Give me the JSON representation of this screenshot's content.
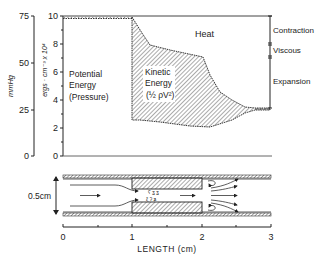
{
  "left_axis": {
    "label": "mmHg",
    "ticks": [
      "75",
      "50",
      "25",
      "0"
    ]
  },
  "right_axis": {
    "label": "ergs · cm⁻³ x 10⁴",
    "ticks": [
      "10",
      "8",
      "6",
      "4",
      "2",
      "0"
    ]
  },
  "regions": {
    "potential": [
      "Potential",
      "Energy",
      "(Pressure)"
    ],
    "kinetic": [
      "Kinetic",
      "Energy",
      "(½ ρV²)"
    ],
    "heat": "Heat"
  },
  "losses": {
    "contraction": "Contraction",
    "viscous": "Viscous",
    "expansion": "Expansion"
  },
  "tube": {
    "diameter_label": "0.5cm"
  },
  "x_axis": {
    "label": "LENGTH (cm)",
    "ticks": [
      "0",
      "1",
      "2",
      "3"
    ]
  },
  "colors": {
    "ink": "#222222",
    "background": "#ffffff"
  }
}
